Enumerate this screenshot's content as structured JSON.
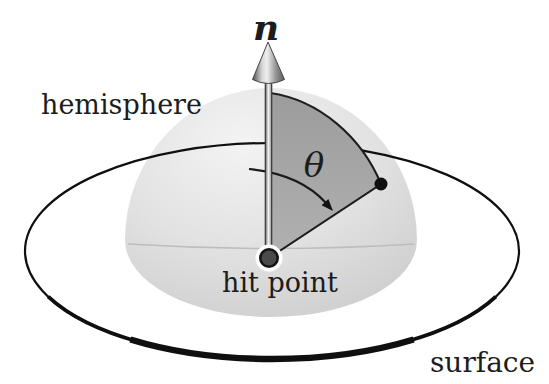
{
  "diagram": {
    "labels": {
      "normal": "n",
      "hemisphere": "hemisphere",
      "angle": "θ",
      "hit_point": "hit point",
      "surface": "surface"
    },
    "colors": {
      "background": "#ffffff",
      "hemisphere_light": "#f2f2f2",
      "hemisphere_dark": "#d0d0d0",
      "wedge_gray": "#a6a6a6",
      "outline_black": "#0f0f0f",
      "text": "#1c1c1c"
    }
  }
}
